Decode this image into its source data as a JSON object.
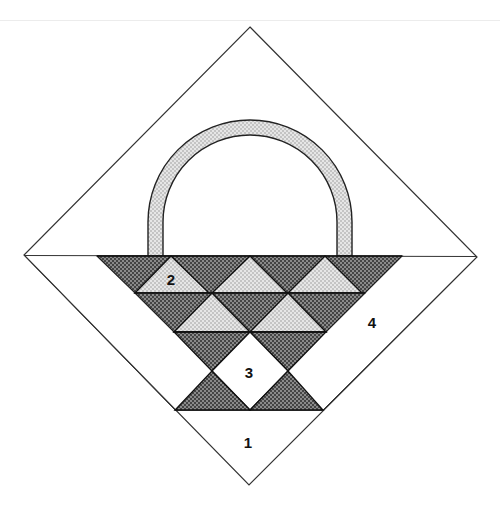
{
  "diagram": {
    "colors": {
      "background": "#ffffff",
      "outline": "#222222",
      "dark_fabric": "#6b6b6b",
      "light_fabric": "#d9d9d9",
      "handle_fabric": "#dcdcdc"
    },
    "labels": [
      {
        "id": "1",
        "text": "1",
        "x": 248,
        "y": 448,
        "region": "bottom corner triangle"
      },
      {
        "id": "2",
        "text": "2",
        "x": 171,
        "y": 285,
        "region": "light triangle, top row"
      },
      {
        "id": "3",
        "text": "3",
        "x": 249,
        "y": 378,
        "region": "center white square"
      },
      {
        "id": "4",
        "text": "4",
        "x": 372,
        "y": 328,
        "region": "side strip"
      }
    ]
  }
}
